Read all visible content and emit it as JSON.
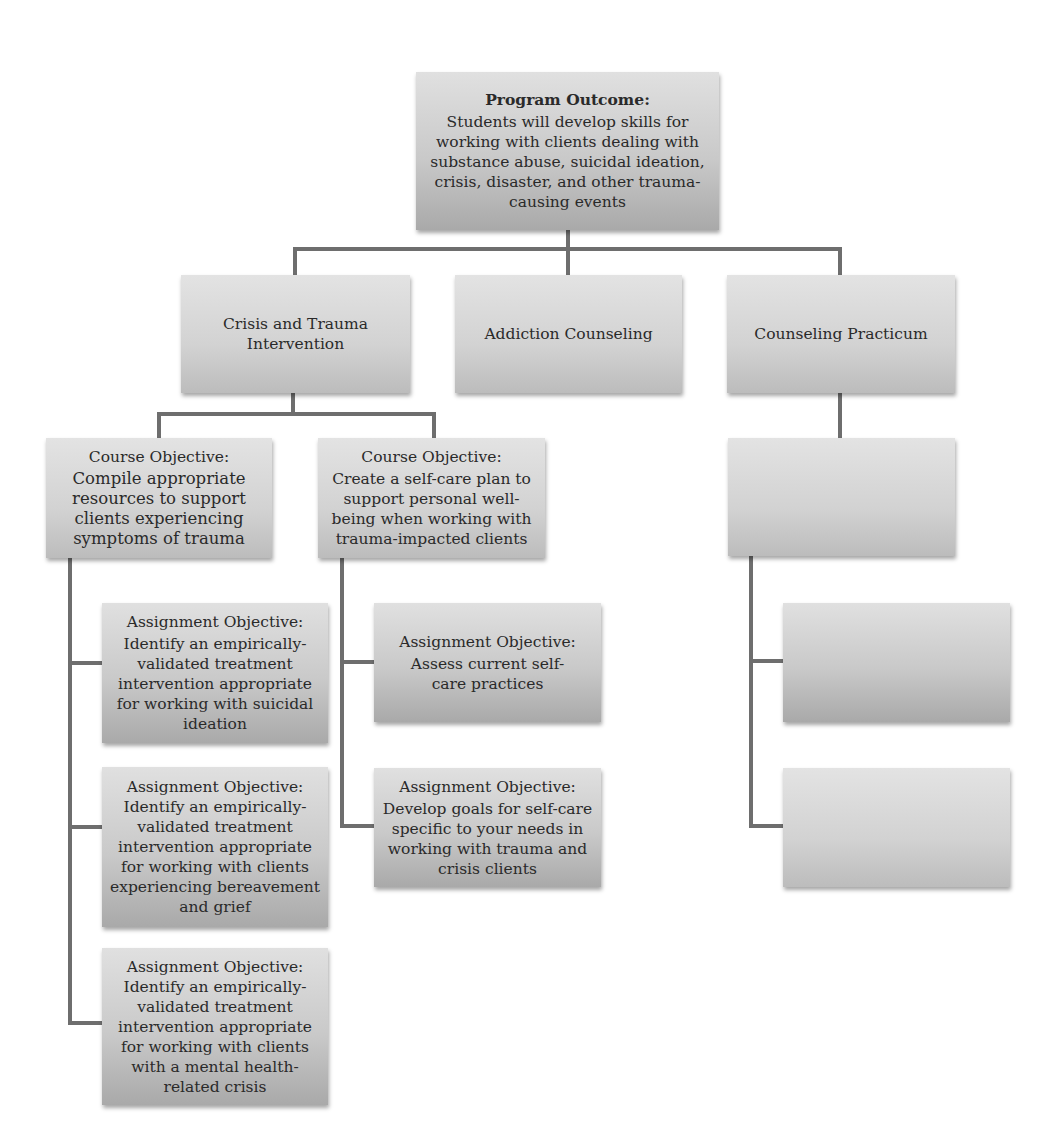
{
  "diagram": {
    "type": "hierarchy",
    "root": {
      "heading": "Program Outcome",
      "heading_suffix": ":",
      "text": "Students will develop skills for working with clients dealing with substance abuse, suicidal ideation, crisis, disaster, and other trauma-causing events"
    },
    "courses": [
      {
        "label": "Crisis and Trauma Intervention",
        "objectives": [
          {
            "heading": "Course Objective:",
            "text": "Compile appropriate resources to support clients experiencing symptoms of trauma",
            "assignments": [
              {
                "heading": "Assignment Objective:",
                "text": "Identify an empirically-validated treatment intervention appropriate for working with suicidal ideation"
              },
              {
                "heading": "Assignment Objective:",
                "text": "Identify an empirically-validated treatment intervention appropriate for working with clients experiencing bereavement and grief"
              },
              {
                "heading": "Assignment Objective:",
                "text": "Identify an empirically-validated treatment intervention appropriate for working with clients with a mental health-related crisis"
              }
            ]
          },
          {
            "heading": "Course Objective:",
            "text": "Create a self-care plan to support personal well-being when working with trauma-impacted clients",
            "assignments": [
              {
                "heading": "Assignment Objective:",
                "text": "Assess current self-care practices"
              },
              {
                "heading": "Assignment Objective:",
                "text": "Develop goals for self-care specific to your needs in working with trauma and crisis clients"
              }
            ]
          }
        ]
      },
      {
        "label": "Addiction Counseling",
        "objectives": []
      },
      {
        "label": "Counseling Practicum",
        "objectives": [
          {
            "heading": "",
            "text": "",
            "assignments": [
              {
                "heading": "",
                "text": ""
              },
              {
                "heading": "",
                "text": ""
              }
            ]
          }
        ]
      }
    ],
    "colors": {
      "box_top": "#e0e0e0",
      "box_bottom": "#a9a9a9",
      "connector": "#6e6e6e",
      "text": "#2a2a2a"
    }
  }
}
